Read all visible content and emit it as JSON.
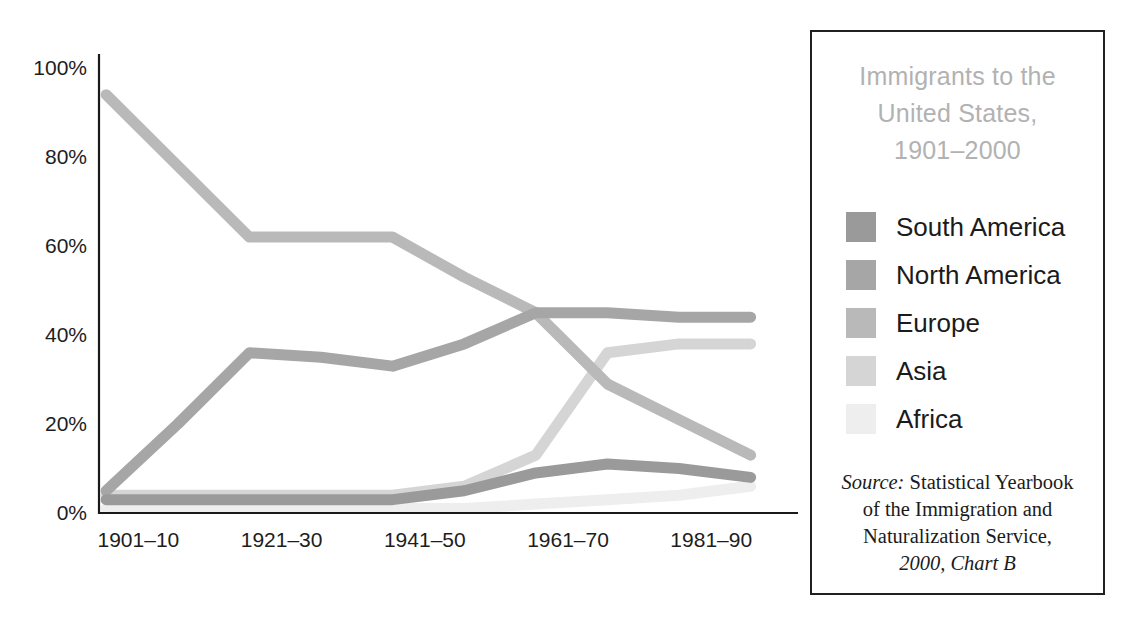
{
  "legend": {
    "title_lines": [
      "Immigrants to the",
      "United States,",
      "1901–2000"
    ],
    "title_color": "#b2b2b2",
    "items": [
      {
        "label": "South America",
        "color": "#9a9a9a"
      },
      {
        "label": "North America",
        "color": "#a6a6a6"
      },
      {
        "label": "Europe",
        "color": "#b9b9b9"
      },
      {
        "label": "Asia",
        "color": "#d5d5d5"
      },
      {
        "label": "Africa",
        "color": "#eeeeee"
      }
    ],
    "source": {
      "label": "Source:",
      "line1": " Statistical Yearbook",
      "line2": "of the Immigration and",
      "line3": "Naturalization Service,",
      "line4": "2000, Chart B"
    }
  },
  "chart_data": {
    "type": "line",
    "title": "Immigrants to the United States, 1901–2000",
    "xlabel": "",
    "ylabel": "",
    "ylim": [
      0,
      100
    ],
    "yticks": [
      0,
      20,
      40,
      60,
      80,
      100
    ],
    "ytick_labels": [
      "0%",
      "20%",
      "40%",
      "60%",
      "80%",
      "100%"
    ],
    "grid": false,
    "legend_position": "right",
    "x": [
      "1901–10",
      "1911–20",
      "1921–30",
      "1931–40",
      "1941–50",
      "1951–60",
      "1961–70",
      "1971–80",
      "1981–90",
      "1991–2000"
    ],
    "xtick_labels_shown": [
      "1901–10",
      "1921–30",
      "1941–50",
      "1961–70",
      "1981–90"
    ],
    "xtick_indices_shown": [
      0,
      2,
      4,
      6,
      8
    ],
    "series": [
      {
        "name": "Europe",
        "color": "#b9b9b9",
        "values": [
          94,
          78,
          62,
          62,
          62,
          53,
          45,
          29,
          21,
          13
        ]
      },
      {
        "name": "North America",
        "color": "#a6a6a6",
        "values": [
          5,
          20,
          36,
          35,
          33,
          38,
          45,
          45,
          44,
          44
        ]
      },
      {
        "name": "Asia",
        "color": "#d5d5d5",
        "values": [
          4,
          4,
          4,
          4,
          4,
          6,
          13,
          36,
          38,
          38
        ]
      },
      {
        "name": "South America",
        "color": "#9a9a9a",
        "values": [
          3,
          3,
          3,
          3,
          3,
          5,
          9,
          11,
          10,
          8
        ]
      },
      {
        "name": "Africa",
        "color": "#eeeeee",
        "values": [
          1,
          1,
          1,
          1,
          1,
          1,
          2,
          3,
          4,
          6
        ]
      }
    ]
  },
  "axes": {
    "x_axis_name": "decade-axis",
    "y_axis_name": "percent-axis"
  }
}
